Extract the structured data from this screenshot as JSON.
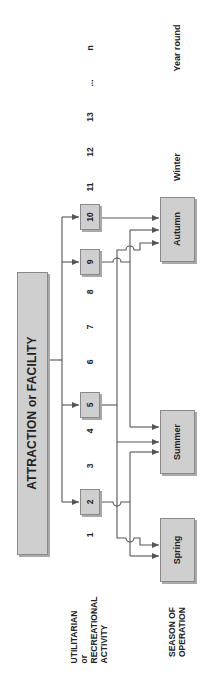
{
  "title": "ATTRACTION or FACILITY",
  "row_labels": {
    "activity": [
      "UTILITARIAN",
      "or",
      "RECREATIONAL",
      "ACTIVITY"
    ],
    "season": [
      "SEASON OF",
      "OPERATION"
    ]
  },
  "activities": {
    "boxed": [
      "2",
      "5",
      "9",
      "10"
    ],
    "unboxed": [
      "1",
      "3",
      "4",
      "6",
      "7",
      "8",
      "11",
      "12",
      "13",
      "...",
      "n"
    ]
  },
  "seasons": {
    "boxed": [
      "Spring",
      "Summer",
      "Autumn"
    ],
    "unboxed": [
      "Winter",
      "Year round"
    ]
  },
  "connections": [
    {
      "from": "2",
      "to": [
        "Spring",
        "Summer"
      ]
    },
    {
      "from": "5",
      "to": [
        "Spring",
        "Summer",
        "Autumn"
      ]
    },
    {
      "from": "9",
      "to": [
        "Summer",
        "Autumn"
      ]
    },
    {
      "from": "10",
      "to": [
        "Autumn"
      ]
    }
  ],
  "colors": {
    "box_fill": "#cfcfcf",
    "line": "#555555"
  }
}
